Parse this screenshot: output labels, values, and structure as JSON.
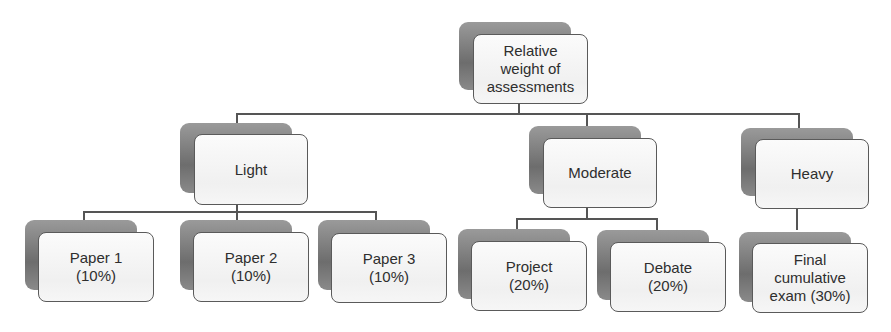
{
  "diagram": {
    "root": {
      "label": "Relative\nweight of\nassessments"
    },
    "categories": [
      {
        "label": "Light",
        "children": [
          {
            "label": "Paper 1\n(10%)"
          },
          {
            "label": "Paper 2\n(10%)"
          },
          {
            "label": "Paper 3\n(10%)"
          }
        ]
      },
      {
        "label": "Moderate",
        "children": [
          {
            "label": "Project\n(20%)"
          },
          {
            "label": "Debate\n(20%)"
          }
        ]
      },
      {
        "label": "Heavy",
        "children": [
          {
            "label": "Final\ncumulative\nexam (30%)"
          }
        ]
      }
    ],
    "colors": {
      "line": "#555555",
      "box_border": "#5a5a5a",
      "shadow": "#7a7a7a",
      "box_fill": "#f4f4f4"
    }
  }
}
